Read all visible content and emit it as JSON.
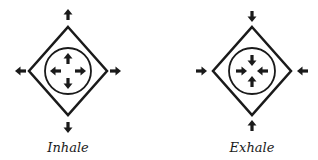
{
  "diagrams": [
    {
      "label": "Inhale",
      "direction": "outward"
    },
    {
      "label": "Exhale",
      "direction": "inward"
    }
  ],
  "colors": {
    "stroke": "#1a1a1a",
    "background": "#ffffff"
  }
}
